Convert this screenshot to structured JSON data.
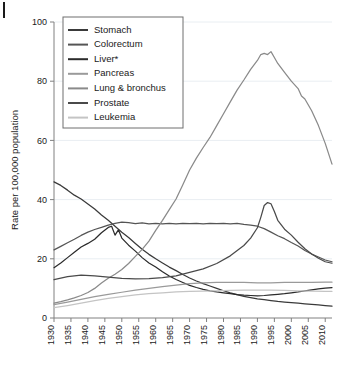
{
  "chart_data": {
    "type": "line",
    "title": "",
    "xlabel": "",
    "ylabel": "Rate per 100,000 population",
    "xlim": [
      1930,
      2012
    ],
    "ylim": [
      0,
      100
    ],
    "yticks": [
      0,
      20,
      40,
      60,
      80,
      100
    ],
    "xticks": [
      1930,
      1935,
      1940,
      1945,
      1950,
      1955,
      1960,
      1965,
      1970,
      1975,
      1980,
      1985,
      1990,
      1995,
      2000,
      2005,
      2010
    ],
    "grid": true,
    "legend_position": "top-left",
    "x": [
      1930,
      1935,
      1940,
      1945,
      1950,
      1955,
      1960,
      1965,
      1970,
      1975,
      1980,
      1985,
      1990,
      1995,
      2000,
      2005,
      2010,
      2012
    ],
    "series": [
      {
        "name": "Stomach",
        "color": "#3a3a3a",
        "values": [
          46,
          42,
          38,
          34,
          29,
          24,
          20,
          16.5,
          13.5,
          11,
          9,
          7.5,
          6.5,
          5.8,
          5.2,
          4.7,
          4.2,
          4.0
        ]
      },
      {
        "name": "Colorectum",
        "color": "#555555",
        "values": [
          23,
          26,
          29,
          31,
          32.5,
          32,
          32,
          32,
          32,
          32,
          32,
          32,
          31,
          29,
          25.5,
          22,
          19.5,
          19.0
        ]
      },
      {
        "name": "Liver*",
        "color": "#2b2b2b",
        "values": [
          17,
          21,
          25,
          30,
          27,
          22,
          18,
          14,
          11,
          9.5,
          8.5,
          7.8,
          7.5,
          7.8,
          8.4,
          9.2,
          10.0,
          10.3
        ]
      },
      {
        "name": "Pancreas",
        "color": "#9a9a9a",
        "values": [
          4.5,
          5.5,
          6.5,
          7.5,
          8.5,
          9.5,
          10.3,
          11,
          11.6,
          11.9,
          12,
          12,
          12,
          12,
          12,
          12,
          12,
          12
        ]
      },
      {
        "name": "Lung & bronchus",
        "color": "#8a8a8a",
        "values": [
          5,
          6,
          8,
          11,
          16,
          23,
          31,
          40,
          52,
          63,
          72,
          80,
          89,
          88,
          81,
          73,
          58,
          52
        ]
      },
      {
        "name": "Prostate",
        "color": "#4a4a4a",
        "values": [
          13,
          14,
          14.5,
          14,
          13.5,
          13.2,
          13.5,
          14,
          15.5,
          17,
          19.5,
          23,
          28,
          38.5,
          31,
          25,
          20,
          18.5
        ]
      },
      {
        "name": "Leukemia",
        "color": "#c4c4c4",
        "values": [
          3.5,
          4.2,
          5,
          5.8,
          6.5,
          7.2,
          7.8,
          8.2,
          8.6,
          8.8,
          9.0,
          9.2,
          9.4,
          9.4,
          9.3,
          9.2,
          9.1,
          9.0
        ]
      }
    ],
    "dense_series": [
      {
        "name": "Stomach",
        "points": [
          [
            1930,
            46.0
          ],
          [
            1932,
            44.8
          ],
          [
            1934,
            43.2
          ],
          [
            1936,
            41.5
          ],
          [
            1938,
            40.2
          ],
          [
            1940,
            38.5
          ],
          [
            1942,
            36.8
          ],
          [
            1944,
            34.8
          ],
          [
            1946,
            33.0
          ],
          [
            1948,
            31.0
          ],
          [
            1950,
            29.0
          ],
          [
            1952,
            27.2
          ],
          [
            1954,
            25.2
          ],
          [
            1956,
            23.2
          ],
          [
            1958,
            21.5
          ],
          [
            1960,
            20.0
          ],
          [
            1962,
            18.6
          ],
          [
            1964,
            17.2
          ],
          [
            1966,
            16.0
          ],
          [
            1968,
            14.7
          ],
          [
            1970,
            13.5
          ],
          [
            1972,
            12.5
          ],
          [
            1974,
            11.6
          ],
          [
            1976,
            10.8
          ],
          [
            1978,
            10.0
          ],
          [
            1980,
            9.2
          ],
          [
            1982,
            8.5
          ],
          [
            1984,
            7.9
          ],
          [
            1986,
            7.3
          ],
          [
            1988,
            6.9
          ],
          [
            1990,
            6.5
          ],
          [
            1992,
            6.2
          ],
          [
            1994,
            5.9
          ],
          [
            1996,
            5.6
          ],
          [
            1998,
            5.4
          ],
          [
            2000,
            5.2
          ],
          [
            2002,
            5.0
          ],
          [
            2004,
            4.8
          ],
          [
            2006,
            4.6
          ],
          [
            2008,
            4.4
          ],
          [
            2010,
            4.2
          ],
          [
            2012,
            4.0
          ]
        ]
      },
      {
        "name": "Colorectum",
        "points": [
          [
            1930,
            23.0
          ],
          [
            1932,
            24.2
          ],
          [
            1934,
            25.4
          ],
          [
            1936,
            26.6
          ],
          [
            1938,
            27.9
          ],
          [
            1940,
            29.0
          ],
          [
            1942,
            29.9
          ],
          [
            1944,
            30.6
          ],
          [
            1946,
            31.4
          ],
          [
            1948,
            32.0
          ],
          [
            1950,
            32.4
          ],
          [
            1952,
            32.2
          ],
          [
            1954,
            31.9
          ],
          [
            1956,
            32.1
          ],
          [
            1958,
            31.8
          ],
          [
            1960,
            32.0
          ],
          [
            1962,
            31.8
          ],
          [
            1964,
            32.0
          ],
          [
            1966,
            31.8
          ],
          [
            1968,
            32.0
          ],
          [
            1970,
            31.9
          ],
          [
            1972,
            32.0
          ],
          [
            1974,
            31.8
          ],
          [
            1976,
            32.0
          ],
          [
            1978,
            31.9
          ],
          [
            1980,
            32.0
          ],
          [
            1982,
            31.8
          ],
          [
            1984,
            32.0
          ],
          [
            1986,
            31.6
          ],
          [
            1988,
            31.4
          ],
          [
            1990,
            31.0
          ],
          [
            1992,
            30.2
          ],
          [
            1994,
            29.0
          ],
          [
            1996,
            27.8
          ],
          [
            1998,
            26.8
          ],
          [
            2000,
            25.5
          ],
          [
            2002,
            24.3
          ],
          [
            2004,
            22.8
          ],
          [
            2006,
            21.6
          ],
          [
            2008,
            20.6
          ],
          [
            2010,
            19.6
          ],
          [
            2012,
            19.0
          ]
        ]
      },
      {
        "name": "Liver*",
        "points": [
          [
            1930,
            17.0
          ],
          [
            1932,
            18.6
          ],
          [
            1934,
            20.4
          ],
          [
            1936,
            22.2
          ],
          [
            1938,
            24.0
          ],
          [
            1940,
            25.2
          ],
          [
            1942,
            26.6
          ],
          [
            1944,
            28.8
          ],
          [
            1946,
            30.6
          ],
          [
            1947,
            31.0
          ],
          [
            1948,
            28.0
          ],
          [
            1949,
            29.8
          ],
          [
            1950,
            27.0
          ],
          [
            1952,
            24.6
          ],
          [
            1954,
            22.6
          ],
          [
            1956,
            20.4
          ],
          [
            1958,
            18.6
          ],
          [
            1960,
            17.2
          ],
          [
            1962,
            15.6
          ],
          [
            1964,
            14.2
          ],
          [
            1966,
            13.0
          ],
          [
            1968,
            12.0
          ],
          [
            1970,
            11.0
          ],
          [
            1972,
            10.3
          ],
          [
            1974,
            9.7
          ],
          [
            1976,
            9.2
          ],
          [
            1978,
            8.8
          ],
          [
            1980,
            8.5
          ],
          [
            1982,
            8.2
          ],
          [
            1984,
            7.9
          ],
          [
            1986,
            7.7
          ],
          [
            1988,
            7.6
          ],
          [
            1990,
            7.5
          ],
          [
            1992,
            7.6
          ],
          [
            1994,
            7.8
          ],
          [
            1996,
            8.0
          ],
          [
            1998,
            8.2
          ],
          [
            2000,
            8.5
          ],
          [
            2002,
            8.8
          ],
          [
            2004,
            9.2
          ],
          [
            2006,
            9.5
          ],
          [
            2008,
            9.8
          ],
          [
            2010,
            10.1
          ],
          [
            2012,
            10.3
          ]
        ]
      },
      {
        "name": "Pancreas",
        "points": [
          [
            1930,
            4.5
          ],
          [
            1934,
            5.4
          ],
          [
            1938,
            6.3
          ],
          [
            1942,
            7.2
          ],
          [
            1946,
            8.0
          ],
          [
            1950,
            8.7
          ],
          [
            1954,
            9.4
          ],
          [
            1958,
            10.0
          ],
          [
            1962,
            10.6
          ],
          [
            1966,
            11.1
          ],
          [
            1970,
            11.6
          ],
          [
            1974,
            11.9
          ],
          [
            1978,
            12.0
          ],
          [
            1982,
            12.0
          ],
          [
            1986,
            12.0
          ],
          [
            1990,
            11.9
          ],
          [
            1994,
            11.9
          ],
          [
            1998,
            12.0
          ],
          [
            2002,
            12.0
          ],
          [
            2006,
            12.0
          ],
          [
            2010,
            12.1
          ],
          [
            2012,
            12.1
          ]
        ]
      },
      {
        "name": "Lung & bronchus",
        "points": [
          [
            1930,
            5.0
          ],
          [
            1932,
            5.5
          ],
          [
            1934,
            6.1
          ],
          [
            1936,
            6.8
          ],
          [
            1938,
            7.6
          ],
          [
            1940,
            8.6
          ],
          [
            1942,
            10.0
          ],
          [
            1944,
            11.8
          ],
          [
            1946,
            13.4
          ],
          [
            1948,
            14.8
          ],
          [
            1950,
            16.4
          ],
          [
            1952,
            18.4
          ],
          [
            1954,
            20.8
          ],
          [
            1956,
            23.2
          ],
          [
            1958,
            26.0
          ],
          [
            1960,
            29.6
          ],
          [
            1962,
            33.0
          ],
          [
            1964,
            36.6
          ],
          [
            1966,
            40.2
          ],
          [
            1968,
            45.0
          ],
          [
            1970,
            50.0
          ],
          [
            1972,
            54.0
          ],
          [
            1974,
            57.6
          ],
          [
            1976,
            61.0
          ],
          [
            1978,
            65.0
          ],
          [
            1980,
            69.0
          ],
          [
            1982,
            73.0
          ],
          [
            1984,
            77.0
          ],
          [
            1986,
            80.4
          ],
          [
            1988,
            84.0
          ],
          [
            1990,
            87.0
          ],
          [
            1991,
            89.0
          ],
          [
            1992,
            89.4
          ],
          [
            1993,
            89.0
          ],
          [
            1994,
            90.0
          ],
          [
            1995,
            88.0
          ],
          [
            1996,
            86.0
          ],
          [
            1998,
            83.0
          ],
          [
            2000,
            80.0
          ],
          [
            2002,
            77.5
          ],
          [
            2003,
            75.0
          ],
          [
            2004,
            74.0
          ],
          [
            2006,
            70.0
          ],
          [
            2008,
            65.0
          ],
          [
            2010,
            59.0
          ],
          [
            2012,
            52.0
          ]
        ]
      },
      {
        "name": "Prostate",
        "points": [
          [
            1930,
            13.0
          ],
          [
            1934,
            14.0
          ],
          [
            1938,
            14.5
          ],
          [
            1942,
            14.2
          ],
          [
            1946,
            13.8
          ],
          [
            1950,
            13.4
          ],
          [
            1954,
            13.2
          ],
          [
            1958,
            13.3
          ],
          [
            1962,
            13.6
          ],
          [
            1966,
            14.2
          ],
          [
            1970,
            15.4
          ],
          [
            1974,
            16.6
          ],
          [
            1978,
            18.4
          ],
          [
            1982,
            21.0
          ],
          [
            1986,
            24.5
          ],
          [
            1988,
            27.0
          ],
          [
            1990,
            30.5
          ],
          [
            1991,
            34.0
          ],
          [
            1992,
            38.0
          ],
          [
            1993,
            39.0
          ],
          [
            1994,
            38.6
          ],
          [
            1995,
            36.0
          ],
          [
            1996,
            33.0
          ],
          [
            1998,
            30.0
          ],
          [
            2000,
            28.0
          ],
          [
            2002,
            25.6
          ],
          [
            2004,
            23.4
          ],
          [
            2006,
            21.6
          ],
          [
            2008,
            20.2
          ],
          [
            2010,
            19.0
          ],
          [
            2012,
            18.5
          ]
        ]
      },
      {
        "name": "Leukemia",
        "points": [
          [
            1930,
            3.5
          ],
          [
            1934,
            4.2
          ],
          [
            1938,
            5.0
          ],
          [
            1942,
            5.9
          ],
          [
            1946,
            6.6
          ],
          [
            1950,
            7.2
          ],
          [
            1954,
            7.8
          ],
          [
            1958,
            8.2
          ],
          [
            1962,
            8.5
          ],
          [
            1966,
            8.8
          ],
          [
            1970,
            9.0
          ],
          [
            1974,
            9.1
          ],
          [
            1978,
            9.2
          ],
          [
            1982,
            9.3
          ],
          [
            1986,
            9.4
          ],
          [
            1990,
            9.4
          ],
          [
            1994,
            9.4
          ],
          [
            1998,
            9.3
          ],
          [
            2002,
            9.2
          ],
          [
            2006,
            9.1
          ],
          [
            2010,
            9.0
          ],
          [
            2012,
            9.0
          ]
        ]
      }
    ]
  },
  "legend": {
    "items": [
      {
        "label": "Stomach"
      },
      {
        "label": "Colorectum"
      },
      {
        "label": "Liver*"
      },
      {
        "label": "Pancreas"
      },
      {
        "label": "Lung & bronchus"
      },
      {
        "label": "Prostate"
      },
      {
        "label": "Leukemia"
      }
    ]
  }
}
